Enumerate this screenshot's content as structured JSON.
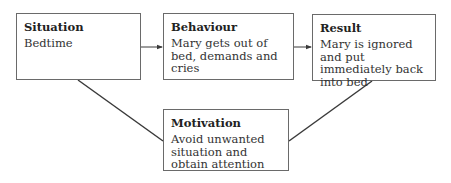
{
  "diagram": {
    "type": "flow",
    "nodes": [
      {
        "id": "situation",
        "title": "Situation",
        "text": "Bedtime"
      },
      {
        "id": "behaviour",
        "title": "Behaviour",
        "text": "Mary gets out of bed, demands and cries"
      },
      {
        "id": "result",
        "title": "Result",
        "text": "Mary is ignored and put immediately back into bed"
      },
      {
        "id": "motivation",
        "title": "Motivation",
        "text": "Avoid unwanted situation and obtain attention"
      }
    ],
    "edges": [
      {
        "from": "situation",
        "to": "behaviour",
        "style": "arrow"
      },
      {
        "from": "behaviour",
        "to": "result",
        "style": "arrow"
      },
      {
        "from": "situation",
        "to": "motivation",
        "style": "line"
      },
      {
        "from": "result",
        "to": "motivation",
        "style": "line"
      }
    ],
    "colors": {
      "border": "#6a6a6a",
      "line": "#3a3a3a",
      "text": "#2a2a2a",
      "background": "#ffffff"
    }
  }
}
